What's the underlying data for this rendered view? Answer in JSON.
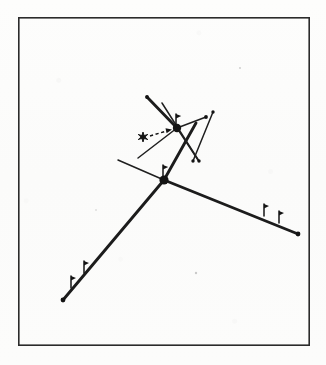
{
  "figure": {
    "canvas": {
      "width": 326,
      "height": 365
    },
    "colors": {
      "background": "#fdfdfc",
      "ink": "#141414",
      "frame": "#2b2b2b"
    },
    "frame": {
      "x": 18,
      "y": 17,
      "width": 292,
      "height": 329
    },
    "nodes": [
      {
        "id": "node-upper",
        "x": 177,
        "y": 128,
        "radius": 4.2
      },
      {
        "id": "node-lower",
        "x": 164,
        "y": 180,
        "radius": 4.6
      }
    ],
    "edges": [
      {
        "id": "edge-upper-northwest",
        "x1": 177,
        "y1": 128,
        "x2": 147,
        "y2": 97,
        "weight": "thick"
      },
      {
        "id": "edge-upper-southeast-long",
        "x1": 177,
        "y1": 128,
        "x2": 196,
        "y2": 160,
        "weight": "thick"
      },
      {
        "id": "edge-upper-northeast",
        "x1": 177,
        "y1": 128,
        "x2": 206,
        "y2": 117,
        "weight": "thin"
      },
      {
        "id": "edge-upper-southwest",
        "x1": 177,
        "y1": 128,
        "x2": 138,
        "y2": 158,
        "weight": "thin"
      },
      {
        "id": "edge-cross-downright",
        "x1": 168,
        "y1": 108,
        "x2": 198,
        "y2": 160,
        "weight": "thin"
      },
      {
        "id": "edge-cross-upright",
        "x1": 205,
        "y1": 118,
        "x2": 212,
        "y2": 112,
        "weight": "thin"
      },
      {
        "id": "edge-diag-rightdown",
        "x1": 212,
        "y1": 113,
        "x2": 193,
        "y2": 161,
        "weight": "thin"
      },
      {
        "id": "edge-lower-northwest",
        "x1": 164,
        "y1": 180,
        "x2": 118,
        "y2": 160,
        "weight": "thin"
      },
      {
        "id": "edge-lower-southwest-long",
        "x1": 164,
        "y1": 180,
        "x2": 63,
        "y2": 300,
        "weight": "thick"
      },
      {
        "id": "edge-lower-southeast-long",
        "x1": 164,
        "y1": 180,
        "x2": 298,
        "y2": 234,
        "weight": "thick"
      },
      {
        "id": "edge-lower-north",
        "x1": 164,
        "y1": 180,
        "x2": 180,
        "y2": 148,
        "weight": "thick"
      }
    ],
    "endpoint_dots": [
      {
        "id": "endpoint-upper-northwest",
        "x": 147,
        "y": 97
      },
      {
        "id": "endpoint-upper-northeast",
        "x": 206,
        "y": 117
      },
      {
        "id": "endpoint-cross-upright",
        "x": 212,
        "y": 112
      },
      {
        "id": "endpoint-diag-rightdown",
        "x": 193,
        "y": 161
      },
      {
        "id": "endpoint-cross-downright",
        "x": 198,
        "y": 160
      },
      {
        "id": "endpoint-lower-left",
        "x": 63,
        "y": 300
      },
      {
        "id": "endpoint-lower-right",
        "x": 298,
        "y": 234
      }
    ],
    "flag_markers": [
      {
        "id": "flag-upper-node",
        "x": 176,
        "y": 114,
        "height": 13
      },
      {
        "id": "flag-lower-node",
        "x": 163,
        "y": 166,
        "height": 13
      },
      {
        "id": "flag-right-inner",
        "x": 264,
        "y": 205,
        "height": 12
      },
      {
        "id": "flag-right-outer",
        "x": 279,
        "y": 212,
        "height": 12
      },
      {
        "id": "flag-lower-upper",
        "x": 84,
        "y": 262,
        "height": 12
      },
      {
        "id": "flag-lower-lower",
        "x": 71,
        "y": 277,
        "height": 12
      }
    ],
    "star_marker": {
      "id": "star",
      "x": 143,
      "y": 137,
      "size": 5
    },
    "dashed_arrow": {
      "id": "arrow",
      "x1": 150,
      "y1": 136,
      "x2": 171,
      "y2": 130
    },
    "specks": [
      {
        "x": 196,
        "y": 273,
        "r": 1.2
      },
      {
        "x": 240,
        "y": 68,
        "r": 0.9
      },
      {
        "x": 96,
        "y": 210,
        "r": 0.8
      }
    ]
  }
}
